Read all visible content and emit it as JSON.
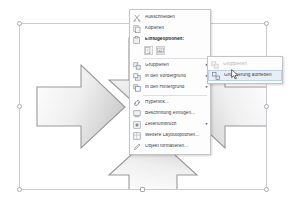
{
  "app": {
    "surface_name": "document-canvas",
    "language": "de"
  },
  "selection": {
    "name": "shape-group-selection",
    "handles": [
      "top-left",
      "top-center",
      "top-right",
      "middle-left",
      "middle-right",
      "bottom-left",
      "bottom-center",
      "bottom-right"
    ],
    "rotate_handle": "rotation-handle"
  },
  "diagram": {
    "center_shape": "circle",
    "arrows": [
      {
        "name": "arrow-down",
        "direction": "down"
      },
      {
        "name": "arrow-right",
        "direction": "right"
      },
      {
        "name": "arrow-left",
        "direction": "left"
      },
      {
        "name": "arrow-up",
        "direction": "up"
      }
    ],
    "fill_color": "#eeeeee",
    "stroke_color": "#9a9a9a"
  },
  "context_menu": {
    "name": "shape-context-menu",
    "items": [
      {
        "label": "Ausschneiden",
        "icon": "scissors-icon",
        "arrow": "",
        "bold": false,
        "disabled": false
      },
      {
        "label": "Kopieren",
        "icon": "copy-icon",
        "arrow": "",
        "bold": false,
        "disabled": false
      },
      {
        "label": "Einfügeoptionen:",
        "icon": "paste-icon",
        "arrow": "",
        "bold": true,
        "disabled": false
      }
    ],
    "paste_options": [
      {
        "name": "paste-keep-source-formatting",
        "icon": "paste-source-icon"
      },
      {
        "name": "paste-picture",
        "icon": "paste-picture-icon"
      }
    ],
    "items2": [
      {
        "label": "Gruppieren",
        "icon": "group-icon",
        "arrow": "▸",
        "bold": false,
        "disabled": false
      },
      {
        "label": "In den Vordergrund",
        "icon": "bring-to-front-icon",
        "arrow": "▸",
        "bold": false,
        "disabled": false
      },
      {
        "label": "In den Hintergrund",
        "icon": "send-to-back-icon",
        "arrow": "▸",
        "bold": false,
        "disabled": false
      }
    ],
    "items3": [
      {
        "label": "Hyperlink...",
        "icon": "hyperlink-icon",
        "arrow": "",
        "bold": false,
        "disabled": false
      },
      {
        "label": "Beschriftung einfügen...",
        "icon": "caption-icon",
        "arrow": "",
        "bold": false,
        "disabled": false
      },
      {
        "label": "Zeilenumbruch",
        "icon": "text-wrap-icon",
        "arrow": "▸",
        "bold": false,
        "disabled": false
      },
      {
        "label": "Weitere Layoutoptionen...",
        "icon": "layout-options-icon",
        "arrow": "",
        "bold": false,
        "disabled": false
      },
      {
        "label": "Objekt formatieren...",
        "icon": "format-object-icon",
        "arrow": "",
        "bold": false,
        "disabled": false
      }
    ]
  },
  "submenu": {
    "name": "gruppieren-submenu",
    "items": [
      {
        "label": "Gruppieren",
        "icon": "group-icon",
        "disabled": true,
        "hover": false
      },
      {
        "label": "Gruppierung aufheben",
        "icon": "ungroup-icon",
        "disabled": false,
        "hover": true
      }
    ]
  },
  "cursor": {
    "name": "mouse-pointer",
    "x": 231,
    "y": 66
  }
}
